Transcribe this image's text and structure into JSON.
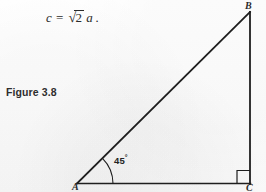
{
  "figure": {
    "caption": "Figure 3.8",
    "background_color": "#fdfdfd",
    "ink_color": "#1e1e1e"
  },
  "equation": {
    "lhs": "c",
    "relation": "=",
    "radical_sign": "√",
    "radicand": "2",
    "rhs_variable": "a",
    "terminator": ".",
    "full_text": "c = √2 a."
  },
  "diagram": {
    "type": "right-triangle",
    "vertices": [
      {
        "label": "A",
        "x": 77,
        "y": 183,
        "position": "bottom-left"
      },
      {
        "label": "B",
        "x": 250,
        "y": 12,
        "position": "top-right"
      },
      {
        "label": "C",
        "x": 250,
        "y": 183,
        "position": "bottom-right"
      }
    ],
    "sides": [
      {
        "name": "base-AC",
        "from": "A",
        "to": "C"
      },
      {
        "name": "vertical-BC",
        "from": "C",
        "to": "B"
      },
      {
        "name": "hypotenuse-AB",
        "from": "A",
        "to": "B"
      }
    ],
    "angle_marker": {
      "at_vertex": "A",
      "value": "45",
      "degree_symbol": "°",
      "label": "45°",
      "arc_radius": 36
    },
    "right_angle_marker": {
      "at_vertex": "C",
      "size": 13
    }
  }
}
